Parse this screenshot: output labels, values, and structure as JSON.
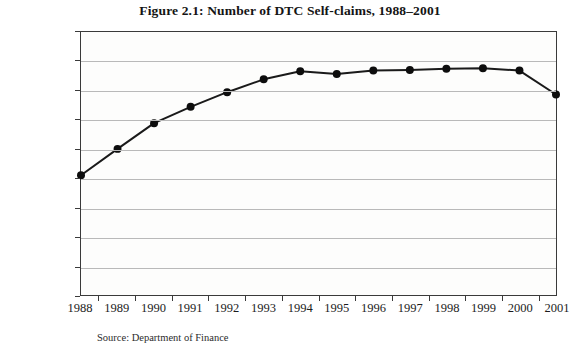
{
  "figure": {
    "title": "Figure 2.1: Number of DTC Self-claims, 1988–2001",
    "source": "Source: Department of Finance"
  },
  "colors": {
    "line": "#1a1a1a",
    "marker": "#0d0d0d",
    "gridline": "#b9b9b9",
    "frame": "#3a3a3a",
    "plot_background": "#fdfdfc",
    "page_background": "#ffffff",
    "text": "#1c1c1c"
  },
  "chart_data": {
    "type": "line",
    "title": "Figure 2.1: Number of DTC Self-claims, 1988–2001",
    "xlabel": "",
    "ylabel": "",
    "categories": [
      "1988",
      "1989",
      "1990",
      "1991",
      "1992",
      "1993",
      "1994",
      "1995",
      "1996",
      "1997",
      "1998",
      "1999",
      "2000",
      "2001"
    ],
    "values": [
      205000,
      250000,
      294000,
      322000,
      347000,
      369000,
      383000,
      378000,
      384000,
      385000,
      387000,
      388000,
      384000,
      343000
    ],
    "ylim": [
      0,
      450000
    ],
    "ytick_labels": [
      "0",
      "50,000",
      "100,000",
      "150,000",
      "200,000",
      "250,000",
      "300,000",
      "350,000",
      "400,000",
      "450,000"
    ],
    "ytick_values": [
      0,
      50000,
      100000,
      150000,
      200000,
      250000,
      300000,
      350000,
      400000,
      450000
    ],
    "grid": true,
    "legend": null,
    "markers": "filled-circle",
    "series_name": "Number of DTC Self-claims"
  }
}
